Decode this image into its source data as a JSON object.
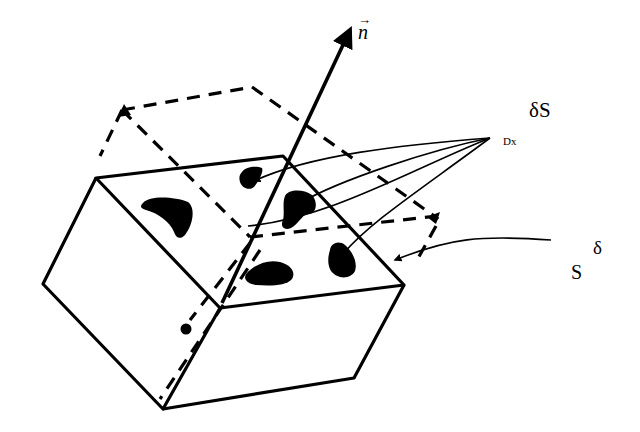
{
  "figure": {
    "colors": {
      "ink": "#000000",
      "background": "#ffffff"
    }
  },
  "labels": {
    "normal_vector": "n",
    "normal_vector_arrow": "→",
    "surface_element": "δS",
    "surface_element_subscript": "Dx",
    "surface_delta": "δ",
    "surface": "S"
  },
  "icons": {
    "normal-arrow": "arrow-up-right",
    "blobs": 5
  }
}
